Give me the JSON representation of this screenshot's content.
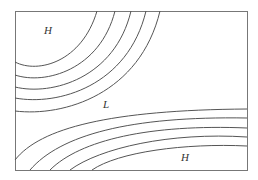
{
  "diagram": {
    "type": "isobar-map",
    "labels": [
      {
        "text": "H",
        "x": 45,
        "y": 29,
        "meaning": "high pressure"
      },
      {
        "text": "L",
        "x": 103,
        "y": 106,
        "meaning": "low pressure"
      },
      {
        "text": "H",
        "x": 182,
        "y": 158,
        "meaning": "high pressure"
      }
    ],
    "colors": {
      "line": "#555555",
      "frame": "#777777",
      "background": "#ffffff"
    },
    "isobar_groups": [
      {
        "name": "upper-left-high",
        "count": 5
      },
      {
        "name": "lower-right-high",
        "count": 5
      }
    ]
  }
}
